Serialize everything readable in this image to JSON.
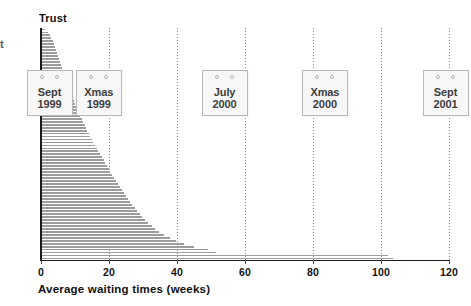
{
  "chart_data": {
    "type": "bar",
    "orientation": "horizontal",
    "title": "",
    "xlabel": "Average waiting times (weeks)",
    "ylabel": "Trust",
    "xlim": [
      0,
      120
    ],
    "xticks": [
      0,
      20,
      40,
      60,
      80,
      100,
      120
    ],
    "xtick_labels": [
      "0",
      "20",
      "40",
      "60",
      "80",
      "100",
      "120"
    ],
    "grid": "vertical dotted gridlines at 20, 40, 60, 80, 100, 120",
    "legend": "none",
    "categories_note": "Each bar is one Trust, sorted ascending by average waiting time; category tick labels are not shown.",
    "values": [
      1.2,
      2.0,
      2.6,
      3.0,
      3.4,
      3.8,
      4.1,
      4.4,
      4.7,
      5.0,
      5.3,
      5.6,
      5.9,
      6.2,
      6.5,
      6.8,
      7.1,
      7.4,
      7.7,
      8.0,
      8.3,
      8.6,
      8.9,
      9.2,
      9.6,
      10.0,
      10.4,
      10.8,
      11.2,
      11.6,
      12.0,
      12.4,
      12.8,
      13.2,
      13.6,
      14.0,
      14.4,
      14.9,
      15.4,
      15.9,
      16.4,
      16.9,
      17.4,
      17.9,
      18.4,
      18.9,
      19.4,
      19.9,
      20.4,
      20.9,
      21.4,
      22.0,
      22.6,
      23.2,
      23.8,
      24.4,
      25.0,
      25.6,
      26.2,
      26.8,
      27.5,
      28.2,
      29.0,
      29.8,
      30.6,
      31.5,
      32.5,
      33.6,
      34.8,
      36.2,
      37.8,
      39.6,
      42.0,
      45.0,
      49.0,
      51.5,
      102.0,
      103.5
    ],
    "annotations": [
      {
        "label_line1": "Sept",
        "label_line2": "1999",
        "x": 2.5
      },
      {
        "label_line1": "Xmas",
        "label_line2": "1999",
        "x": 17.0
      },
      {
        "label_line1": "July",
        "label_line2": "2000",
        "x": 54.0
      },
      {
        "label_line1": "Xmas",
        "label_line2": "2000",
        "x": 83.5
      },
      {
        "label_line1": "Sept",
        "label_line2": "2001",
        "x": 119.0
      }
    ],
    "colors": {
      "bar": "#9d9d9d",
      "axis": "#1a1a1a",
      "gridline": "#8c8c8c",
      "text": "#111111",
      "calendar_fill": "#f7f7f7",
      "calendar_border": "#b8b8b8",
      "calendar_text": "#3d3d3d"
    }
  },
  "axis": {
    "y_title": "Trust",
    "x_title": "Average waiting times (weeks)"
  },
  "clipped_left_text": "t"
}
